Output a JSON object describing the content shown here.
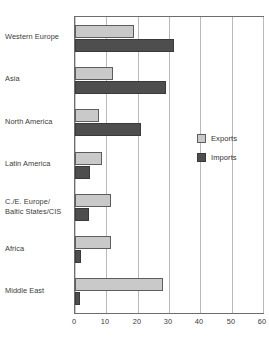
{
  "chart_data": {
    "type": "bar",
    "orientation": "horizontal",
    "title": "",
    "subtitle": "",
    "xlabel": "",
    "ylabel": "",
    "xlim": [
      0,
      60
    ],
    "xticks": [
      "0",
      "10",
      "20",
      "30",
      "40",
      "50",
      "60"
    ],
    "xtick_values": [
      0,
      10,
      20,
      30,
      40,
      50,
      60
    ],
    "grid": "vertical",
    "legend_position": "inside-right",
    "categories": [
      "Western Europe",
      "Asia",
      "North America",
      "Latin America",
      "C./E. Europe/\nBaltic States/CIS",
      "Africa",
      "Middle East"
    ],
    "series": [
      {
        "name": "Exports",
        "color": "#c9c9c9",
        "values": [
          18.8,
          12.0,
          7.7,
          8.5,
          11.5,
          11.5,
          28.0
        ]
      },
      {
        "name": "Imports",
        "color": "#4e4e4e",
        "values": [
          31.5,
          29.0,
          21.0,
          4.7,
          4.4,
          2.0,
          1.5
        ]
      }
    ]
  },
  "legend": {
    "entries": [
      {
        "label": "Exports",
        "icon": "square-swatch-light"
      },
      {
        "label": "Imports",
        "icon": "square-swatch-dark"
      }
    ]
  },
  "colors": {
    "exports_fill": "#c9c9c9",
    "exports_stroke": "#5d5d5d",
    "imports_fill": "#4e4e4e",
    "imports_stroke": "#3a3a3a",
    "gridline": "#b9b9b9",
    "axis": "#6d6d6d",
    "text": "#3b3b3b",
    "background": "#ffffff"
  }
}
